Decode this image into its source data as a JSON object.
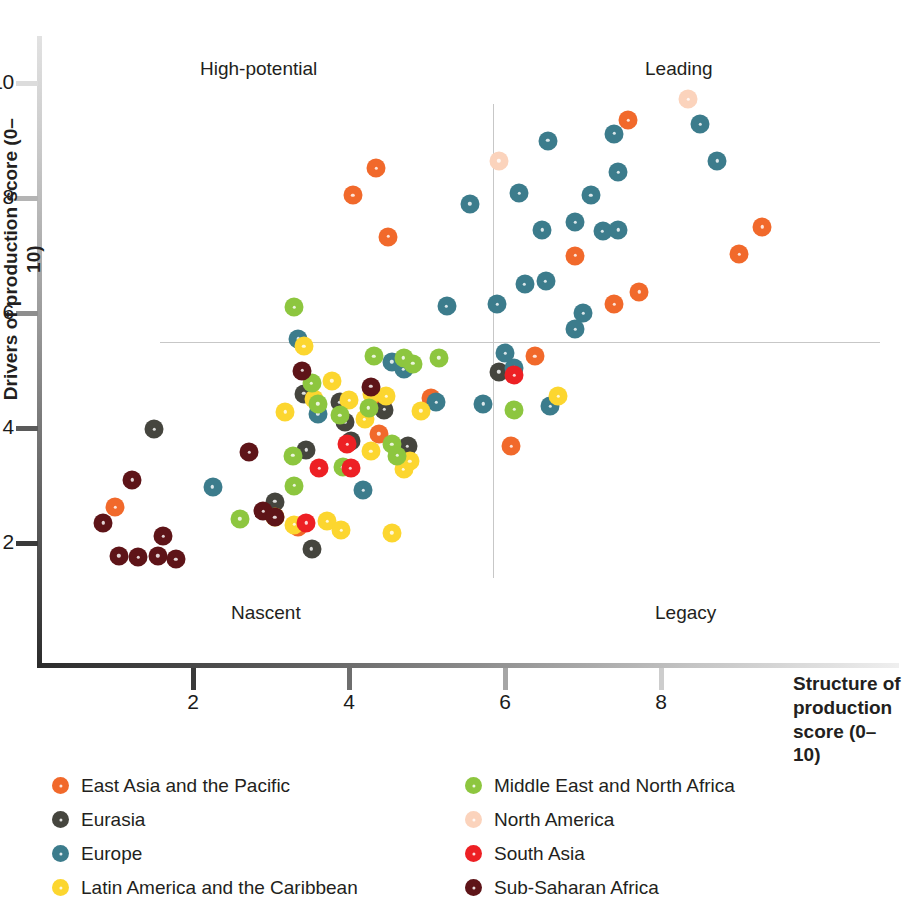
{
  "axes": {
    "x_title_lines": [
      "Structure of",
      "production",
      "score (0–10)"
    ],
    "y_title": "Drivers of production score (0–10)",
    "x_ticks": [
      "2",
      "4",
      "6",
      "8"
    ],
    "y_ticks": [
      "10",
      "8",
      "6",
      "4",
      "2"
    ]
  },
  "quadrants": [
    {
      "name": "high-potential",
      "label": "High-potential"
    },
    {
      "name": "leading",
      "label": "Leading"
    },
    {
      "name": "nascent",
      "label": "Nascent"
    },
    {
      "name": "legacy",
      "label": "Legacy"
    }
  ],
  "legend": {
    "left": [
      {
        "label": "East Asia and the Pacific",
        "color": "#F1692B",
        "key": "east-asia-pacific"
      },
      {
        "label": "Eurasia",
        "color": "#45453E",
        "key": "eurasia"
      },
      {
        "label": "Europe",
        "color": "#3C7C8C",
        "key": "europe"
      },
      {
        "label": "Latin America and the Caribbean",
        "color": "#FCD62F",
        "key": "latin-america-caribbean"
      }
    ],
    "right": [
      {
        "label": "Middle East and North Africa",
        "color": "#8DC63F",
        "key": "middle-east-north-africa"
      },
      {
        "label": "North America",
        "color": "#FBD3BC",
        "key": "north-america"
      },
      {
        "label": "South Asia",
        "color": "#ED2024",
        "key": "south-asia"
      },
      {
        "label": "Sub-Saharan Africa",
        "color": "#5E1418",
        "key": "sub-saharan-africa"
      }
    ]
  },
  "chart_data": {
    "type": "scatter",
    "title": "",
    "xlabel": "Structure of production score (0–10)",
    "ylabel": "Drivers of production score (0–10)",
    "xlim": [
      0.5,
      9.6
    ],
    "ylim": [
      1.2,
      10.3
    ],
    "grid": false,
    "quadrant_lines": {
      "x": 5.85,
      "y": 5.5
    },
    "legend_position": "below",
    "series": [
      {
        "name": "East Asia and the Pacific",
        "color": "#F1692B",
        "points": [
          [
            1.0,
            2.62
          ],
          [
            3.35,
            2.28
          ],
          [
            4.05,
            8.05
          ],
          [
            4.35,
            8.52
          ],
          [
            4.5,
            7.33
          ],
          [
            4.42,
            4.42
          ],
          [
            5.05,
            4.53
          ],
          [
            4.38,
            3.9
          ],
          [
            6.08,
            3.68
          ],
          [
            6.38,
            5.25
          ],
          [
            6.9,
            7.0
          ],
          [
            7.4,
            6.15
          ],
          [
            7.72,
            6.37
          ],
          [
            9.0,
            7.02
          ],
          [
            9.3,
            7.5
          ],
          [
            7.58,
            9.35
          ]
        ]
      },
      {
        "name": "Eurasia",
        "color": "#45453E",
        "points": [
          [
            1.5,
            3.98
          ],
          [
            3.05,
            2.72
          ],
          [
            3.42,
            4.6
          ],
          [
            3.95,
            4.1
          ],
          [
            3.45,
            3.62
          ],
          [
            3.52,
            1.9
          ],
          [
            4.02,
            3.78
          ],
          [
            4.75,
            3.68
          ],
          [
            4.45,
            4.32
          ],
          [
            5.92,
            4.98
          ],
          [
            3.88,
            4.45
          ]
        ]
      },
      {
        "name": "Europe",
        "color": "#3C7C8C",
        "points": [
          [
            2.25,
            2.98
          ],
          [
            3.35,
            5.55
          ],
          [
            3.6,
            4.25
          ],
          [
            4.18,
            2.92
          ],
          [
            4.55,
            5.15
          ],
          [
            4.7,
            5.02
          ],
          [
            5.12,
            4.45
          ],
          [
            5.25,
            6.12
          ],
          [
            5.72,
            4.42
          ],
          [
            5.55,
            7.9
          ],
          [
            5.9,
            6.15
          ],
          [
            6.12,
            5.05
          ],
          [
            6.25,
            6.5
          ],
          [
            6.52,
            6.55
          ],
          [
            6.48,
            7.45
          ],
          [
            6.18,
            8.08
          ],
          [
            6.55,
            9.0
          ],
          [
            6.9,
            7.58
          ],
          [
            7.0,
            6.0
          ],
          [
            6.9,
            5.72
          ],
          [
            7.1,
            8.05
          ],
          [
            7.25,
            7.42
          ],
          [
            7.45,
            7.45
          ],
          [
            7.45,
            8.45
          ],
          [
            7.4,
            9.12
          ],
          [
            6.58,
            4.38
          ],
          [
            8.5,
            9.28
          ],
          [
            8.72,
            8.65
          ],
          [
            6.0,
            5.3
          ]
        ]
      },
      {
        "name": "Latin America and the Caribbean",
        "color": "#FCD62F",
        "points": [
          [
            3.05,
            2.45
          ],
          [
            3.3,
            2.32
          ],
          [
            3.42,
            5.42
          ],
          [
            3.55,
            4.5
          ],
          [
            3.72,
            2.38
          ],
          [
            3.78,
            4.82
          ],
          [
            3.9,
            2.22
          ],
          [
            4.0,
            4.48
          ],
          [
            4.2,
            4.15
          ],
          [
            4.28,
            3.6
          ],
          [
            4.55,
            2.18
          ],
          [
            4.48,
            4.55
          ],
          [
            4.7,
            3.28
          ],
          [
            4.92,
            4.3
          ],
          [
            4.78,
            3.42
          ],
          [
            6.68,
            4.55
          ],
          [
            3.18,
            4.28
          ],
          [
            4.3,
            4.6
          ]
        ]
      },
      {
        "name": "Middle East and North Africa",
        "color": "#8DC63F",
        "points": [
          [
            2.6,
            2.42
          ],
          [
            3.3,
            6.1
          ],
          [
            3.28,
            3.52
          ],
          [
            3.52,
            4.78
          ],
          [
            3.6,
            4.42
          ],
          [
            3.88,
            4.22
          ],
          [
            3.92,
            3.32
          ],
          [
            4.32,
            5.25
          ],
          [
            4.55,
            3.72
          ],
          [
            4.62,
            3.52
          ],
          [
            4.7,
            5.22
          ],
          [
            4.82,
            5.12
          ],
          [
            5.15,
            5.22
          ],
          [
            6.12,
            4.32
          ],
          [
            3.3,
            3.0
          ],
          [
            4.25,
            4.35
          ]
        ]
      },
      {
        "name": "North America",
        "color": "#FBD3BC",
        "points": [
          [
            8.35,
            9.72
          ],
          [
            5.92,
            8.65
          ]
        ]
      },
      {
        "name": "South Asia",
        "color": "#ED2024",
        "points": [
          [
            3.62,
            3.3
          ],
          [
            3.45,
            2.35
          ],
          [
            3.98,
            3.72
          ],
          [
            4.02,
            3.3
          ],
          [
            6.12,
            4.92
          ]
        ]
      },
      {
        "name": "Sub-Saharan Africa",
        "color": "#5E1418",
        "points": [
          [
            0.85,
            2.35
          ],
          [
            1.05,
            1.78
          ],
          [
            1.22,
            3.1
          ],
          [
            1.3,
            1.75
          ],
          [
            1.55,
            1.78
          ],
          [
            1.62,
            2.12
          ],
          [
            1.78,
            1.72
          ],
          [
            2.72,
            3.58
          ],
          [
            2.9,
            2.55
          ],
          [
            3.05,
            2.45
          ],
          [
            3.4,
            5.0
          ],
          [
            4.28,
            4.72
          ]
        ]
      }
    ]
  }
}
